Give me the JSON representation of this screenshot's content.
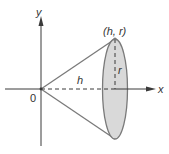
{
  "diagram": {
    "type": "cone-of-revolution",
    "labels": {
      "y_axis": "y",
      "x_axis": "x",
      "origin": "0",
      "apex_point": "(h, r)",
      "height": "h",
      "radius": "r"
    },
    "colors": {
      "line": "#7a7a7a",
      "axis": "#3a3a3a",
      "fill": "#d9d9d9",
      "text": "#333333"
    }
  }
}
